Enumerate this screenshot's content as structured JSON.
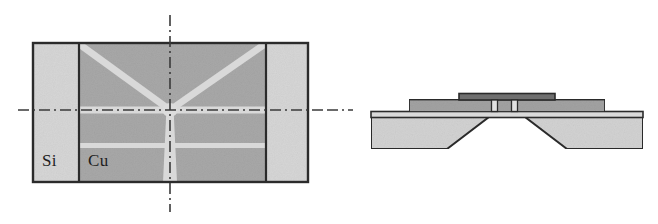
{
  "figure": {
    "width": 658,
    "height": 224,
    "background": "#ffffff",
    "type": "engineering-schematic"
  },
  "palette": {
    "background": "#ffffff",
    "outline": "#2b2b2b",
    "silicon_light": "#d6d6d6",
    "copper_mid": "#a8a8a8",
    "spoke_light": "#d9d9d9",
    "hub_light": "#dcdcdc",
    "centerline": "#3a3a3a",
    "substrate_light": "#d2d2d2",
    "layer_mid": "#a2a2a2",
    "layer_dark": "#6f6f6f",
    "slot_light": "#e0e0e0",
    "membrane_light": "#dadada"
  },
  "plan_view": {
    "name": "plan-view",
    "outer_rect": {
      "x": 33,
      "y": 43,
      "width": 275,
      "height": 139
    },
    "regions": [
      {
        "name": "silicon-left",
        "material": "Si",
        "x": 33,
        "y": 43,
        "width": 46,
        "height": 139,
        "fill": "#d6d6d6"
      },
      {
        "name": "copper-center",
        "material": "Cu",
        "x": 79,
        "y": 43,
        "width": 187,
        "height": 139,
        "fill": "#a8a8a8"
      },
      {
        "name": "silicon-right",
        "material": "Si",
        "x": 266,
        "y": 43,
        "width": 42,
        "height": 139,
        "fill": "#d6d6d6"
      }
    ],
    "labels": [
      {
        "name": "si-label",
        "text": "Si",
        "x": 42,
        "y": 152
      },
      {
        "name": "cu-label",
        "text": "Cu",
        "x": 88,
        "y": 152
      }
    ],
    "hub": {
      "name": "center-hub",
      "cx": 170,
      "cy": 110,
      "rx": 7,
      "ry": 7
    },
    "spokes": [
      {
        "name": "spoke-upper-left",
        "kind": "diagonal",
        "from": [
          80,
          45
        ],
        "to": [
          170,
          110
        ],
        "width": 7
      },
      {
        "name": "spoke-upper-right",
        "kind": "diagonal",
        "from": [
          264,
          45
        ],
        "to": [
          170,
          110
        ],
        "width": 7
      },
      {
        "name": "spoke-left",
        "kind": "horizontal",
        "from": [
          79,
          110
        ],
        "to": [
          170,
          110
        ],
        "width": 7
      },
      {
        "name": "spoke-right",
        "kind": "horizontal",
        "from": [
          170,
          110
        ],
        "to": [
          266,
          110
        ],
        "width": 7
      },
      {
        "name": "spoke-down-tapered",
        "kind": "vertical-tapered",
        "from": [
          170,
          110
        ],
        "to": [
          170,
          182
        ],
        "width_top": 7,
        "width_bottom": 13
      }
    ],
    "slots": [
      {
        "name": "slot-band-lower",
        "x": 79,
        "y": 143,
        "width": 187,
        "height": 5
      }
    ],
    "centerlines": [
      {
        "name": "centerline-horizontal",
        "orientation": "horizontal",
        "from": [
          18,
          110
        ],
        "to": [
          345,
          110
        ],
        "style": "dash-dot"
      },
      {
        "name": "centerline-vertical",
        "orientation": "vertical",
        "from": [
          170,
          15
        ],
        "to": [
          170,
          212
        ],
        "style": "dash-dot"
      }
    ]
  },
  "section_view": {
    "name": "cross-section-view",
    "centerline": {
      "name": "centerline-horizontal-right",
      "orientation": "horizontal",
      "from": [
        330,
        110
      ],
      "to": [
        352,
        110
      ],
      "style": "dash-dot"
    },
    "layers": [
      {
        "name": "substrate-base",
        "material": "Si",
        "x": 371,
        "y": 117,
        "width": 272,
        "height": 32,
        "fill": "#d2d2d2",
        "note": "bulk substrate with anisotropically etched trapezoidal cavity at centre"
      },
      {
        "name": "membrane-layer",
        "material": "thin-film",
        "x": 371,
        "y": 112,
        "width": 272,
        "height": 5,
        "fill": "#dadada"
      },
      {
        "name": "metal-layer-mid",
        "material": "Cu",
        "x": 409,
        "y": 100,
        "width": 196,
        "height": 12,
        "fill": "#a2a2a2"
      },
      {
        "name": "cap-layer-dark",
        "material": "cap",
        "x": 459,
        "y": 94,
        "width": 96,
        "height": 6,
        "fill": "#6f6f6f"
      }
    ],
    "cavity": {
      "name": "etched-cavity",
      "top_left": 489,
      "top_right": 525,
      "bottom_left": 447,
      "bottom_right": 567,
      "top_y": 117,
      "bottom_y": 149
    },
    "slots": [
      {
        "name": "slot-left",
        "x": 492,
        "y": 100,
        "width": 6,
        "height": 12,
        "fill": "#e0e0e0"
      },
      {
        "name": "slot-right",
        "x": 512,
        "y": 100,
        "width": 6,
        "height": 12,
        "fill": "#e0e0e0"
      }
    ]
  }
}
